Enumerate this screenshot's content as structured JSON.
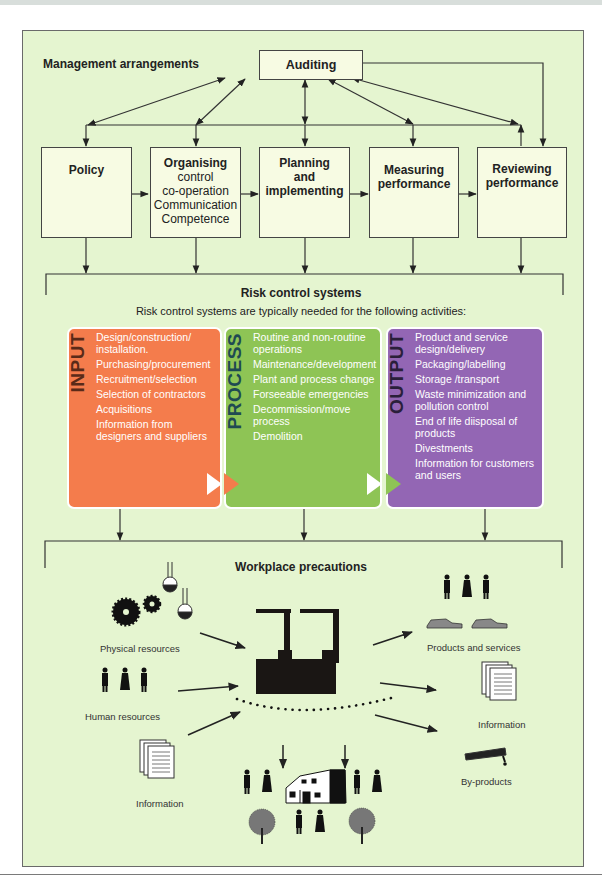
{
  "management": {
    "title": "Management arrangements",
    "auditing": "Auditing",
    "boxes": [
      {
        "title": "Policy",
        "lines": []
      },
      {
        "title": "Organising",
        "lines": [
          "control",
          "co-operation",
          "Communication",
          "Competence"
        ]
      },
      {
        "title_lines": [
          "Planning",
          "and",
          "implementing"
        ]
      },
      {
        "title_lines": [
          "Measuring",
          "performance"
        ]
      },
      {
        "title_lines": [
          "Reviewing",
          "performance"
        ]
      }
    ]
  },
  "risk": {
    "title": "Risk control systems",
    "subtitle": "Risk control systems are typically needed for the following activities:",
    "panels": [
      {
        "label": "INPUT",
        "color": "#f47c4c",
        "label_color": "#5a2a18",
        "items": [
          "Design/construction/ installation.",
          "Purchasing/procurement",
          "Recruitment/selection",
          "Selection of contractors",
          "Acquisitions",
          "Information from designers and suppliers"
        ]
      },
      {
        "label": "PROCESS",
        "color": "#8ec455",
        "label_color": "#1f4a52",
        "items": [
          "Routine and non-routine operations",
          "Maintenance/development",
          "Plant and process change",
          "Forseeable emergencies",
          "Decommission/move process",
          "Demolition"
        ]
      },
      {
        "label": "OUTPUT",
        "color": "#9366b4",
        "label_color": "#2a1f3a",
        "items": [
          "Product and service design/delivery",
          "Packaging/labelling",
          "Storage /transport",
          "Waste minimization and pollution control",
          "End of life diisposal of products",
          "Divestments",
          "Information for customers and users"
        ]
      }
    ]
  },
  "workplace": {
    "title": "Workplace precautions",
    "inputs": [
      "Physical resources",
      "Human resources",
      "Information"
    ],
    "outputs": [
      "Products and services",
      "Information",
      "By-products"
    ]
  },
  "colors": {
    "background": "#e5f5d0",
    "box_fill": "#f7fbe3",
    "input": "#f47c4c",
    "process": "#8ec455",
    "output": "#9366b4"
  }
}
